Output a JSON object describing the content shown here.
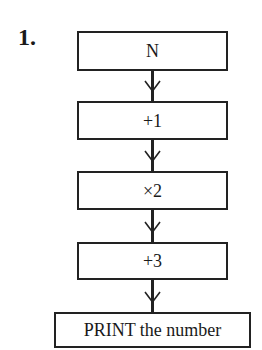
{
  "question": {
    "number": "1."
  },
  "flowchart": {
    "steps": [
      {
        "label": "N"
      },
      {
        "label": "+1"
      },
      {
        "label": "×2"
      },
      {
        "label": "+3"
      },
      {
        "label": "PRINT the number"
      }
    ],
    "connector_icon": "down-arrow-icon",
    "colors": {
      "line": "#222222",
      "background": "#ffffff"
    }
  }
}
